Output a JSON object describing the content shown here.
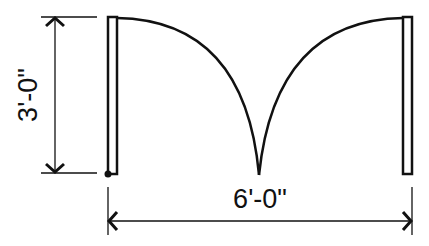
{
  "diagram": {
    "type": "double-door-plan",
    "labels": {
      "height_dimension": "3'-0\"",
      "width_dimension": "6'-0\""
    },
    "colors": {
      "line": "#111111",
      "background": "#ffffff"
    }
  }
}
